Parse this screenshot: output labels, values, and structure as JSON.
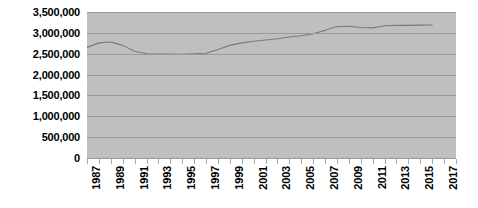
{
  "chart_data": {
    "type": "line",
    "title": "",
    "xlabel": "",
    "ylabel": "",
    "ylim": [
      0,
      3500000
    ],
    "xlim": [
      1987,
      2018
    ],
    "grid": true,
    "legend": false,
    "y_ticks": [
      "3,500,000",
      "3,000,000",
      "2,500,000",
      "2,000,000",
      "1,500,000",
      "1,000,000",
      "500,000",
      "0"
    ],
    "y_tick_values": [
      3500000,
      3000000,
      2500000,
      2000000,
      1500000,
      1000000,
      500000,
      0
    ],
    "x_tick_labels": [
      "1987",
      "1989",
      "1991",
      "1993",
      "1995",
      "1997",
      "1999",
      "2001",
      "2003",
      "2005",
      "2007",
      "2009",
      "2011",
      "2013",
      "2015",
      "2017"
    ],
    "x_minor_years": [
      1987,
      1988,
      1989,
      1990,
      1991,
      1992,
      1993,
      1994,
      1995,
      1996,
      1997,
      1998,
      1999,
      2000,
      2001,
      2002,
      2003,
      2004,
      2005,
      2006,
      2007,
      2008,
      2009,
      2010,
      2011,
      2012,
      2013,
      2014,
      2015,
      2016,
      2017,
      2018
    ],
    "series": [
      {
        "name": "series-1",
        "color": "#7a7a7a",
        "x": [
          1987,
          1988,
          1989,
          1990,
          1991,
          1992,
          1993,
          1994,
          1995,
          1996,
          1997,
          1998,
          1999,
          2000,
          2001,
          2002,
          2003,
          2004,
          2005,
          2006,
          2007,
          2008,
          2009,
          2010,
          2011,
          2012,
          2013,
          2014,
          2015,
          2016
        ],
        "values": [
          2650000,
          2760000,
          2780000,
          2700000,
          2560000,
          2500000,
          2490000,
          2490000,
          2485000,
          2500000,
          2510000,
          2600000,
          2700000,
          2760000,
          2800000,
          2830000,
          2860000,
          2900000,
          2930000,
          2980000,
          3060000,
          3150000,
          3160000,
          3130000,
          3120000,
          3170000,
          3180000,
          3180000,
          3185000,
          3190000
        ]
      }
    ],
    "colors": {
      "plot_background": "#bfbfbf",
      "gridline": "#9a9a9a",
      "line": "#7a7a7a",
      "text": "#000000",
      "page_background": "#ffffff"
    }
  }
}
